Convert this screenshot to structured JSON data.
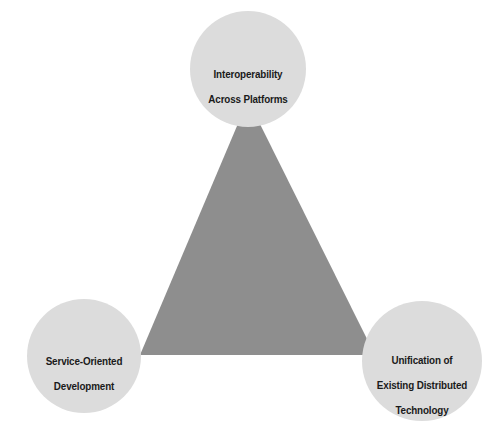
{
  "diagram": {
    "type": "triangle-venn",
    "title": "",
    "canvas": {
      "width": 496,
      "height": 429,
      "background": "#ffffff"
    },
    "shape": {
      "name": "triangle",
      "fill": "#8e8e8e",
      "vertices": [
        {
          "x": 248,
          "y": 100
        },
        {
          "x": 140,
          "y": 355
        },
        {
          "x": 375,
          "y": 355
        }
      ]
    },
    "node_style": {
      "fill": "#dcdcdc",
      "radius": 58,
      "text_color": "#1a1a1a"
    },
    "nodes": [
      {
        "id": "interoperability",
        "position": "top",
        "cx": 248,
        "cy": 69,
        "r": 58,
        "lines": [
          "Interoperability",
          "Across Platforms"
        ],
        "label": "Interoperability\nAcross Platforms"
      },
      {
        "id": "service-oriented-development",
        "position": "bottom-left",
        "cx": 84,
        "cy": 356,
        "r": 57,
        "lines": [
          "Service-Oriented",
          "Development"
        ],
        "label": "Service-Oriented\nDevelopment"
      },
      {
        "id": "unification-existing-distributed-technology",
        "position": "bottom-right",
        "cx": 422,
        "cy": 361,
        "r": 60,
        "lines": [
          "Unification of",
          "Existing Distributed",
          "Technology"
        ],
        "label": "Unification of\nExisting Distributed\nTechnology"
      }
    ]
  }
}
